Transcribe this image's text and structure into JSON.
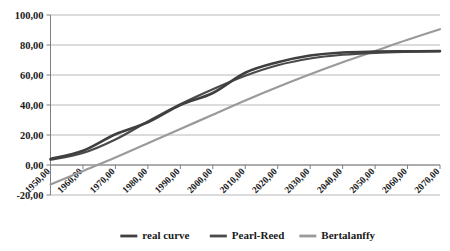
{
  "chart_data": {
    "type": "line",
    "title": "",
    "xlabel": "",
    "ylabel": "",
    "xlim": [
      1950,
      2070
    ],
    "ylim": [
      -20,
      100
    ],
    "grid": true,
    "legend_position": "bottom",
    "x_tick_labels": [
      "1950,00",
      "1960,00",
      "1970,00",
      "1980,00",
      "1990,00",
      "2000,00",
      "2010,00",
      "2020,00",
      "2030,00",
      "2040,00",
      "2050,00",
      "2060,00",
      "2070,00"
    ],
    "y_tick_labels": [
      "-20,00",
      "0,00",
      "20,00",
      "40,00",
      "60,00",
      "80,00",
      "100,00"
    ],
    "y_ticks": [
      -20,
      0,
      20,
      40,
      60,
      80,
      100
    ],
    "x": [
      1950,
      1960,
      1970,
      1980,
      1990,
      2000,
      2010,
      2020,
      2030,
      2040,
      2050,
      2060,
      2070
    ],
    "series": [
      {
        "name": "real curve",
        "color": "#3f3f3f",
        "width": 2.6,
        "values": [
          4.0,
          9.5,
          20.5,
          28.5,
          40.0,
          48.0,
          61.5,
          68.5,
          73.0,
          75.0,
          75.6,
          75.8,
          76.0
        ]
      },
      {
        "name": "Pearl-Reed",
        "color": "#4a4a4a",
        "width": 2.2,
        "values": [
          3.5,
          8.0,
          17.0,
          29.0,
          40.5,
          50.5,
          59.5,
          66.5,
          71.0,
          73.5,
          74.8,
          75.4,
          75.7
        ]
      },
      {
        "name": "Bertalanffy",
        "color": "#9a9a9a",
        "width": 2.2,
        "values": [
          -13.0,
          -4.0,
          5.0,
          14.5,
          24.0,
          33.5,
          43.0,
          52.0,
          60.5,
          68.5,
          76.0,
          83.5,
          90.5
        ]
      }
    ]
  },
  "legend": {
    "items": [
      {
        "label": "real curve",
        "color": "#3f3f3f"
      },
      {
        "label": "Pearl-Reed",
        "color": "#4a4a4a"
      },
      {
        "label": "Bertalanffy",
        "color": "#9a9a9a"
      }
    ]
  }
}
